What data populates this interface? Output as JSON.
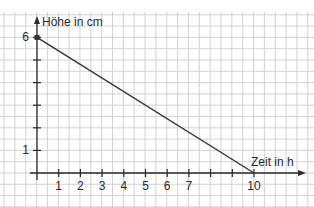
{
  "header": {
    "cropped_text": "(z.B. ... )"
  },
  "chart_data": {
    "type": "line",
    "title": "",
    "xlabel": "Zeit in h",
    "ylabel": "Höhe in cm",
    "x_ticks": [
      1,
      2,
      3,
      4,
      5,
      6,
      7,
      8,
      9,
      10
    ],
    "x_tick_labels": [
      "1",
      "2",
      "3",
      "4",
      "5",
      "6",
      "7",
      "",
      "",
      "10"
    ],
    "y_ticks": [
      1,
      2,
      3,
      4,
      5,
      6
    ],
    "y_tick_labels": [
      "1",
      "",
      "",
      "",
      "",
      "6"
    ],
    "xlim": [
      0,
      12
    ],
    "ylim": [
      0,
      6.5
    ],
    "grid": true,
    "series": [
      {
        "name": "Höhe",
        "x": [
          0,
          10
        ],
        "y": [
          6,
          0
        ]
      }
    ],
    "colors": {
      "line": "#333333",
      "grid": "#c8c8c8",
      "axis": "#2a2a2a"
    }
  }
}
